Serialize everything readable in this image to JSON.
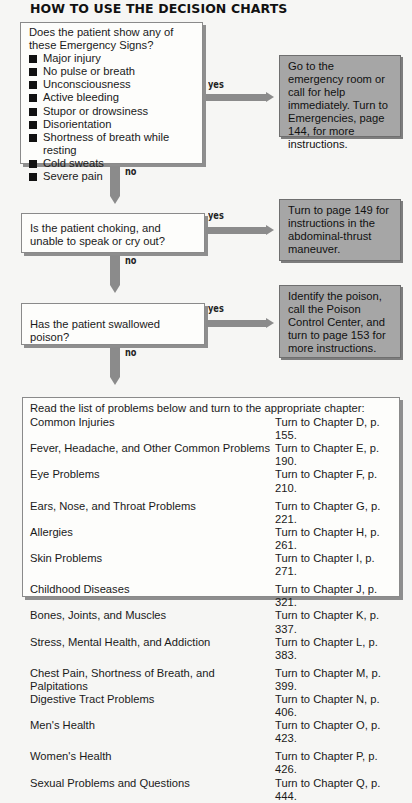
{
  "title": "HOW TO USE THE DECISION CHARTS",
  "question1": {
    "text": "Does the patient show any of these Emergency Signs?",
    "signs": [
      "Major injury",
      "No pulse or breath",
      "Unconsciousness",
      "Active bleeding",
      "Stupor or drowsiness",
      "Disorientation",
      "Shortness of breath while resting",
      "Cold sweats",
      "Severe pain"
    ],
    "yes_label": "yes",
    "no_label": "no",
    "yes_action": "Go to the emergency room or call for help immediately. Turn to Emergencies, page 144, for more instructions."
  },
  "question2": {
    "text": "Is the patient choking, and unable to speak or cry out?",
    "yes_label": "yes",
    "no_label": "no",
    "yes_action": "Turn to page 149 for instructions in the abdominal-thrust maneuver."
  },
  "question3": {
    "text": "Has the patient swallowed poison?",
    "yes_label": "yes",
    "no_label": "no",
    "yes_action": "Identify the poison, call the Poison Control Center, and turn to page 153 for more instructions."
  },
  "chapter_list": {
    "intro": "Read the list of problems below and turn to the appropriate chapter:",
    "groups": [
      [
        {
          "problem": "Common Injuries",
          "ref": "Turn to Chapter D, p. 155."
        },
        {
          "problem": "Fever, Headache, and Other Common Problems",
          "ref": "Turn to Chapter E, p. 190."
        },
        {
          "problem": "Eye Problems",
          "ref": "Turn to Chapter F, p. 210."
        }
      ],
      [
        {
          "problem": "Ears, Nose, and Throat Problems",
          "ref": "Turn to Chapter G, p. 221."
        },
        {
          "problem": "Allergies",
          "ref": "Turn to Chapter H, p. 261."
        },
        {
          "problem": "Skin Problems",
          "ref": "Turn to Chapter I, p. 271."
        }
      ],
      [
        {
          "problem": "Childhood Diseases",
          "ref": "Turn to Chapter J, p. 321."
        },
        {
          "problem": "Bones, Joints, and Muscles",
          "ref": "Turn to Chapter K, p. 337."
        },
        {
          "problem": "Stress, Mental Health, and Addiction",
          "ref": "Turn to Chapter L, p. 383."
        }
      ],
      [
        {
          "problem": "Chest Pain, Shortness of Breath, and Palpitations",
          "ref": "Turn to Chapter M, p. 399."
        },
        {
          "problem": "Digestive Tract Problems",
          "ref": "Turn to Chapter N, p. 406."
        },
        {
          "problem": "Men's Health",
          "ref": "Turn to Chapter O, p. 423."
        }
      ],
      [
        {
          "problem": "Women's Health",
          "ref": "Turn to Chapter P, p. 426."
        },
        {
          "problem": "Sexual Problems and Questions",
          "ref": "Turn to Chapter Q, p. 444."
        }
      ]
    ]
  },
  "colors": {
    "background": "#f6f6f4",
    "question_box": "#fdfdfb",
    "action_box": "#a6a6a6",
    "arrow": "#8b8b8b"
  }
}
